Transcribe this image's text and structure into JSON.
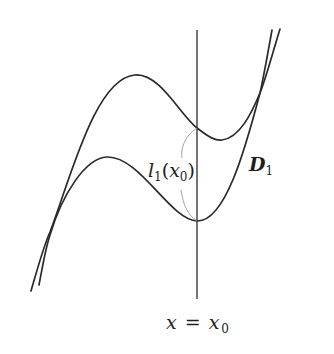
{
  "diagram": {
    "labels": {
      "length": {
        "main": "l",
        "sub": "1",
        "open": "(",
        "var": "x",
        "var_sub": "0",
        "close": ")"
      },
      "region": {
        "main": "D",
        "sub": "1"
      },
      "line": {
        "lhs": "x",
        "eq": "=",
        "rhs": "x",
        "rhs_sub": "0"
      }
    },
    "colors": {
      "curve": "#2a2a2a",
      "arc": "#9a9a9a",
      "background": "#ffffff"
    }
  }
}
